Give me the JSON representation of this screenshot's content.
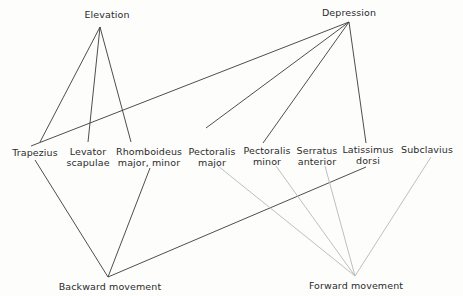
{
  "diagram": {
    "colors": {
      "dark_line": "#3a3a3a",
      "light_line": "#b8b8b8",
      "text": "#2b2b2b",
      "background": "#fdfdfc"
    },
    "actions": {
      "elevation": "Elevation",
      "depression": "Depression",
      "backward": "Backward movement",
      "forward": "Forward movement"
    },
    "muscles": {
      "trapezius": {
        "line1": "Trapezius"
      },
      "levator": {
        "line1": "Levator",
        "line2": "scapulae"
      },
      "rhomboideus": {
        "line1": "Rhomboideus",
        "line2": "major, minor"
      },
      "pect_major": {
        "line1": "Pectoralis",
        "line2": "major"
      },
      "pect_minor": {
        "line1": "Pectoralis",
        "line2": "minor"
      },
      "serratus": {
        "line1": "Serratus",
        "line2": "anterior"
      },
      "latissimus": {
        "line1": "Latissimus",
        "line2": "dorsi"
      },
      "subclavius": {
        "line1": "Subclavius"
      }
    },
    "connections": [
      {
        "from": "Elevation",
        "to": "Trapezius",
        "style": "dark"
      },
      {
        "from": "Elevation",
        "to": "Levator scapulae",
        "style": "dark"
      },
      {
        "from": "Elevation",
        "to": "Rhomboideus major, minor",
        "style": "dark"
      },
      {
        "from": "Depression",
        "to": "Trapezius",
        "style": "dark"
      },
      {
        "from": "Depression",
        "to": "Pectoralis major",
        "style": "dark"
      },
      {
        "from": "Depression",
        "to": "Pectoralis minor",
        "style": "dark"
      },
      {
        "from": "Depression",
        "to": "Latissimus dorsi",
        "style": "dark"
      },
      {
        "from": "Backward movement",
        "to": "Trapezius",
        "style": "dark"
      },
      {
        "from": "Backward movement",
        "to": "Rhomboideus major, minor",
        "style": "dark"
      },
      {
        "from": "Backward movement",
        "to": "Latissimus dorsi",
        "style": "dark"
      },
      {
        "from": "Forward movement",
        "to": "Pectoralis major",
        "style": "light"
      },
      {
        "from": "Forward movement",
        "to": "Pectoralis minor",
        "style": "light"
      },
      {
        "from": "Forward movement",
        "to": "Serratus anterior",
        "style": "light"
      },
      {
        "from": "Forward movement",
        "to": "Subclavius",
        "style": "light"
      }
    ]
  }
}
